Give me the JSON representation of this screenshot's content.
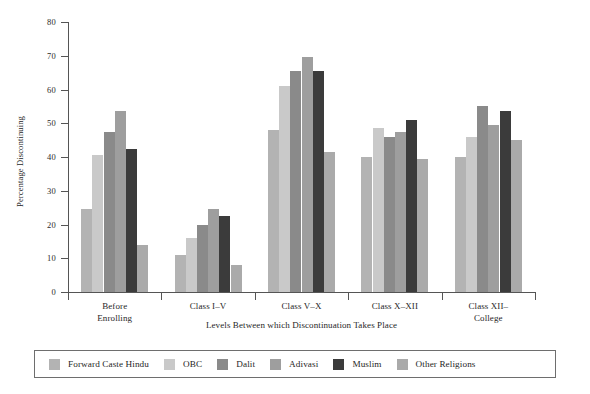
{
  "chart_data": {
    "type": "bar",
    "title": "",
    "xlabel": "Levels Between which Discontinuation Takes Place",
    "ylabel": "Percentage Discontinuing",
    "ylim": [
      0,
      80
    ],
    "yticks": [
      0,
      10,
      20,
      30,
      40,
      50,
      60,
      70,
      80
    ],
    "ytick_labels": [
      "0",
      "10",
      "20",
      "30",
      "40",
      "50",
      "60",
      "70",
      "80"
    ],
    "grid": false,
    "legend_position": "bottom",
    "categories": [
      "Before\nEnrolling",
      "Class I–V",
      "Class V–X",
      "Class X–XII",
      "Class XII–\nCollege"
    ],
    "category_lines": [
      [
        "Before",
        "Enrolling"
      ],
      [
        "Class I–V",
        ""
      ],
      [
        "Class V–X",
        ""
      ],
      [
        "Class X–XII",
        ""
      ],
      [
        "Class XII–",
        "College"
      ]
    ],
    "series": [
      {
        "name": "Forward Caste Hindu",
        "color": "#b3b3b3",
        "values": [
          24.5,
          11.0,
          48.0,
          40.0,
          40.0
        ]
      },
      {
        "name": "OBC",
        "color": "#c9c9c9",
        "values": [
          40.5,
          16.0,
          61.0,
          48.5,
          46.0
        ]
      },
      {
        "name": "Dalit",
        "color": "#8a8a8a",
        "values": [
          47.5,
          20.0,
          65.5,
          46.0,
          55.0
        ]
      },
      {
        "name": "Adivasi",
        "color": "#9e9e9e",
        "values": [
          53.5,
          24.5,
          69.5,
          47.5,
          49.5
        ]
      },
      {
        "name": "Muslim",
        "color": "#3b3b3b",
        "values": [
          42.5,
          22.5,
          65.5,
          51.0,
          53.5
        ]
      },
      {
        "name": "Other Religions",
        "color": "#aaaaaa",
        "values": [
          14.0,
          8.0,
          41.5,
          39.5,
          45.0
        ]
      }
    ]
  },
  "legend": {
    "items": [
      {
        "label": "Forward Caste Hindu",
        "color": "#b3b3b3"
      },
      {
        "label": "OBC",
        "color": "#c9c9c9"
      },
      {
        "label": "Dalit",
        "color": "#8a8a8a"
      },
      {
        "label": "Adivasi",
        "color": "#9e9e9e"
      },
      {
        "label": "Muslim",
        "color": "#3b3b3b"
      },
      {
        "label": "Other Religions",
        "color": "#aaaaaa"
      }
    ]
  },
  "axes": {
    "y_title": "Percentage Discontinuing",
    "x_title": "Levels Between which Discontinuation Takes Place"
  }
}
